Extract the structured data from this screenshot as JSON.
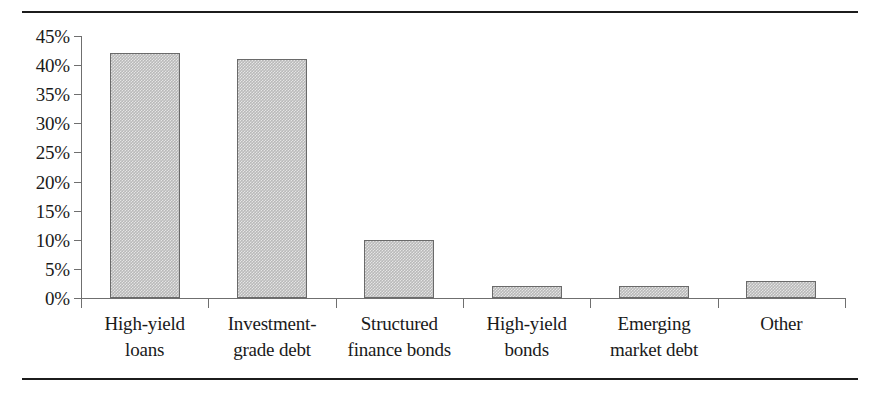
{
  "chart_data": {
    "type": "bar",
    "title": "",
    "subtitle": "",
    "xlabel": "",
    "ylabel": "",
    "categories": [
      "High-yield loans",
      "Investment-grade debt",
      "Structured finance bonds",
      "High-yield bonds",
      "Emerging market debt",
      "Other"
    ],
    "category_lines": [
      [
        "High-yield",
        "loans"
      ],
      [
        "Investment-",
        "grade debt"
      ],
      [
        "Structured",
        "finance bonds"
      ],
      [
        "High-yield",
        "bonds"
      ],
      [
        "Emerging",
        "market debt"
      ],
      [
        "Other"
      ]
    ],
    "values": [
      42,
      41,
      10,
      2,
      2,
      3
    ],
    "value_labels": [
      "42%",
      "41%",
      "10%",
      "2%",
      "2%",
      "3%"
    ],
    "ylim": [
      0,
      45
    ],
    "ytick_values": [
      0,
      5,
      10,
      15,
      20,
      25,
      30,
      35,
      40,
      45
    ],
    "ytick_labels": [
      "0%",
      "5%",
      "10%",
      "15%",
      "20%",
      "25%",
      "30%",
      "35%",
      "40%",
      "45%"
    ],
    "grid": false,
    "legend": null,
    "legend_position": "none",
    "bar_fill_color": "#b9b9b9",
    "bar_edge_color": "#6a6a6a",
    "axis_color": "#6f6f6f",
    "rule_color": "#1c1c1c",
    "text_color": "#1a1a1a"
  }
}
